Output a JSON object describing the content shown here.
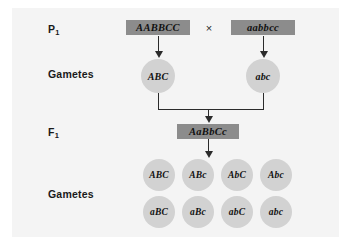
{
  "diagram": {
    "colors": {
      "panel_background": "#f4f4f4",
      "genotype_box": "#8c8c8c",
      "gamete_circle": "#d2d2d2",
      "line": "#2b2b2b",
      "text": "#111111"
    },
    "rows": {
      "p1_label": "P",
      "p1_subscript": "1",
      "gametes_label_1": "Gametes",
      "f1_label": "F",
      "f1_subscript": "1",
      "gametes_label_2": "Gametes"
    },
    "parental": {
      "left_genotype": "AABBCC",
      "cross_symbol": "×",
      "right_genotype": "aabbcc"
    },
    "parental_gametes": [
      {
        "label": "ABC"
      },
      {
        "label": "abc"
      }
    ],
    "f1": {
      "genotype": "AaBbCc"
    },
    "f1_gametes": [
      {
        "label": "ABC"
      },
      {
        "label": "ABc"
      },
      {
        "label": "AbC"
      },
      {
        "label": "Abc"
      },
      {
        "label": "aBC"
      },
      {
        "label": "aBc"
      },
      {
        "label": "abC"
      },
      {
        "label": "abc"
      }
    ]
  }
}
